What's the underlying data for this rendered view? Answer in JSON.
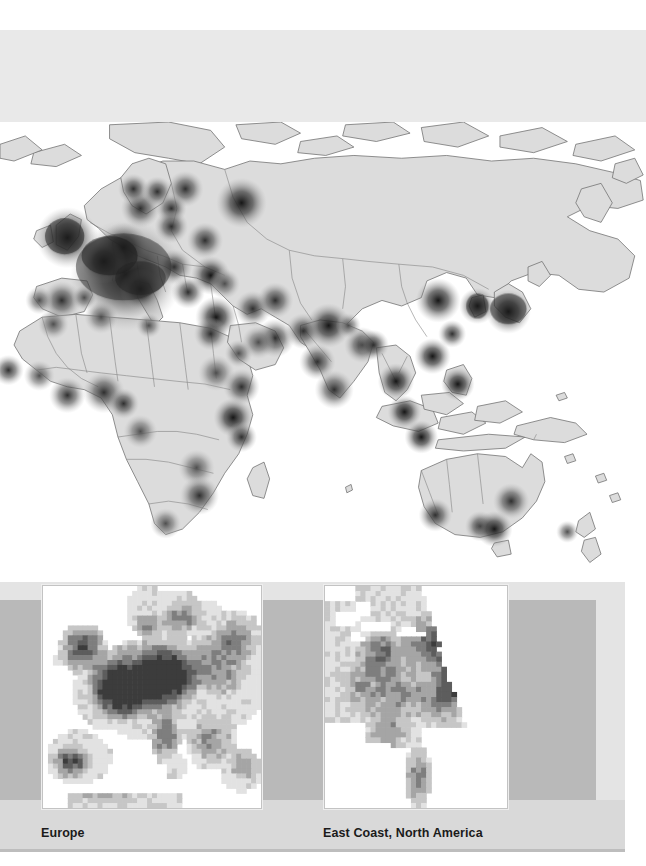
{
  "figure": {
    "kind": "thematic world map with regional detail insets",
    "background_color": "#ffffff",
    "band_tint_color": "#e4e4e4",
    "band_dark_color": "#b9b9b9",
    "caption_band_color": "#d9d9d9"
  },
  "world_map": {
    "name": "world-density-map",
    "land_fill": "#dcdcdc",
    "ocean_fill": "#ffffff",
    "border_stroke": "#6f6f6f",
    "hotspot_palette": [
      "#bdbdbd",
      "#9a9a9a",
      "#6e6e6e",
      "#474747",
      "#2a2a2a"
    ],
    "hotspots": [
      {
        "name": "Western Europe core",
        "x": 90,
        "y": 110,
        "r": 40,
        "level": 5
      },
      {
        "name": "British Isles",
        "x": 48,
        "y": 83,
        "r": 22,
        "level": 5
      },
      {
        "name": "Benelux / Rhine",
        "x": 88,
        "y": 90,
        "r": 18,
        "level": 5
      },
      {
        "name": "Paris basin",
        "x": 74,
        "y": 100,
        "r": 16,
        "level": 5
      },
      {
        "name": "North Italy",
        "x": 100,
        "y": 120,
        "r": 15,
        "level": 5
      },
      {
        "name": "Madrid",
        "x": 44,
        "y": 128,
        "r": 14,
        "level": 4
      },
      {
        "name": "Lisbon",
        "x": 28,
        "y": 128,
        "r": 10,
        "level": 3
      },
      {
        "name": "Barcelona",
        "x": 60,
        "y": 126,
        "r": 9,
        "level": 3
      },
      {
        "name": "Denmark / South Scandinavia",
        "x": 100,
        "y": 62,
        "r": 14,
        "level": 4
      },
      {
        "name": "Oslo",
        "x": 95,
        "y": 48,
        "r": 11,
        "level": 4
      },
      {
        "name": "Stockholm",
        "x": 112,
        "y": 50,
        "r": 11,
        "level": 4
      },
      {
        "name": "Helsinki / St Petersburg",
        "x": 132,
        "y": 48,
        "r": 13,
        "level": 4
      },
      {
        "name": "Baltic",
        "x": 122,
        "y": 62,
        "r": 11,
        "level": 4
      },
      {
        "name": "Warsaw",
        "x": 122,
        "y": 75,
        "r": 12,
        "level": 4
      },
      {
        "name": "Moscow",
        "x": 172,
        "y": 58,
        "r": 18,
        "level": 5
      },
      {
        "name": "Kyiv",
        "x": 146,
        "y": 85,
        "r": 13,
        "level": 4
      },
      {
        "name": "Balkans",
        "x": 124,
        "y": 104,
        "r": 13,
        "level": 4
      },
      {
        "name": "Greece / Athens",
        "x": 134,
        "y": 122,
        "r": 12,
        "level": 4
      },
      {
        "name": "Istanbul",
        "x": 150,
        "y": 110,
        "r": 14,
        "level": 5
      },
      {
        "name": "Ankara",
        "x": 160,
        "y": 116,
        "r": 11,
        "level": 3
      },
      {
        "name": "Levant / Tel Aviv",
        "x": 154,
        "y": 140,
        "r": 15,
        "level": 5
      },
      {
        "name": "Cairo",
        "x": 150,
        "y": 152,
        "r": 12,
        "level": 4
      },
      {
        "name": "Baghdad",
        "x": 180,
        "y": 134,
        "r": 13,
        "level": 4
      },
      {
        "name": "Tehran",
        "x": 196,
        "y": 128,
        "r": 13,
        "level": 4
      },
      {
        "name": "Gulf / Dubai",
        "x": 196,
        "y": 155,
        "r": 14,
        "level": 4
      },
      {
        "name": "Riyadh",
        "x": 184,
        "y": 158,
        "r": 12,
        "level": 3
      },
      {
        "name": "Jeddah",
        "x": 170,
        "y": 166,
        "r": 10,
        "level": 3
      },
      {
        "name": "Casablanca",
        "x": 38,
        "y": 145,
        "r": 11,
        "level": 3
      },
      {
        "name": "Algiers / Tunis",
        "x": 72,
        "y": 140,
        "r": 12,
        "level": 3
      },
      {
        "name": "Tripoli",
        "x": 106,
        "y": 146,
        "r": 9,
        "level": 3
      },
      {
        "name": "Khartoum",
        "x": 154,
        "y": 180,
        "r": 13,
        "level": 3
      },
      {
        "name": "Addis Ababa",
        "x": 172,
        "y": 190,
        "r": 13,
        "level": 4
      },
      {
        "name": "Dakar",
        "x": 6,
        "y": 178,
        "r": 11,
        "level": 4
      },
      {
        "name": "Bamako",
        "x": 28,
        "y": 182,
        "r": 11,
        "level": 3
      },
      {
        "name": "Accra / Abidjan",
        "x": 48,
        "y": 196,
        "r": 13,
        "level": 4
      },
      {
        "name": "Lagos",
        "x": 74,
        "y": 194,
        "r": 15,
        "level": 4
      },
      {
        "name": "Douala",
        "x": 88,
        "y": 202,
        "r": 11,
        "level": 4
      },
      {
        "name": "Kinshasa",
        "x": 100,
        "y": 222,
        "r": 12,
        "level": 3
      },
      {
        "name": "Nairobi",
        "x": 166,
        "y": 212,
        "r": 14,
        "level": 5
      },
      {
        "name": "Dar es Salaam",
        "x": 172,
        "y": 226,
        "r": 11,
        "level": 4
      },
      {
        "name": "Lusaka / Harare",
        "x": 140,
        "y": 248,
        "r": 13,
        "level": 3
      },
      {
        "name": "Johannesburg",
        "x": 142,
        "y": 268,
        "r": 14,
        "level": 4
      },
      {
        "name": "Cape Town",
        "x": 118,
        "y": 288,
        "r": 11,
        "level": 3
      },
      {
        "name": "Karachi",
        "x": 216,
        "y": 150,
        "r": 13,
        "level": 4
      },
      {
        "name": "Delhi",
        "x": 234,
        "y": 146,
        "r": 16,
        "level": 5
      },
      {
        "name": "Mumbai",
        "x": 226,
        "y": 172,
        "r": 13,
        "level": 4
      },
      {
        "name": "Bangalore / Chennai",
        "x": 238,
        "y": 192,
        "r": 14,
        "level": 4
      },
      {
        "name": "Kolkata",
        "x": 258,
        "y": 160,
        "r": 13,
        "level": 4
      },
      {
        "name": "Dhaka",
        "x": 266,
        "y": 160,
        "r": 11,
        "level": 4
      },
      {
        "name": "Kathmandu",
        "x": 248,
        "y": 146,
        "r": 9,
        "level": 3
      },
      {
        "name": "Bangkok",
        "x": 282,
        "y": 186,
        "r": 13,
        "level": 5
      },
      {
        "name": "Singapore / Kuala Lumpur",
        "x": 288,
        "y": 208,
        "r": 12,
        "level": 5
      },
      {
        "name": "Jakarta",
        "x": 300,
        "y": 226,
        "r": 12,
        "level": 5
      },
      {
        "name": "Manila",
        "x": 326,
        "y": 188,
        "r": 12,
        "level": 5
      },
      {
        "name": "Hong Kong / Guangzhou",
        "x": 308,
        "y": 168,
        "r": 13,
        "level": 5
      },
      {
        "name": "Shanghai",
        "x": 322,
        "y": 152,
        "r": 10,
        "level": 4
      },
      {
        "name": "Beijing",
        "x": 312,
        "y": 128,
        "r": 16,
        "level": 5
      },
      {
        "name": "Seoul",
        "x": 340,
        "y": 132,
        "r": 13,
        "level": 5
      },
      {
        "name": "Tokyo / Honshu",
        "x": 362,
        "y": 136,
        "r": 16,
        "level": 5
      },
      {
        "name": "Perth",
        "x": 310,
        "y": 282,
        "r": 12,
        "level": 4
      },
      {
        "name": "Adelaide",
        "x": 342,
        "y": 290,
        "r": 11,
        "level": 4
      },
      {
        "name": "Melbourne",
        "x": 352,
        "y": 292,
        "r": 13,
        "level": 5
      },
      {
        "name": "Sydney / Brisbane",
        "x": 364,
        "y": 272,
        "r": 13,
        "level": 4
      },
      {
        "name": "Auckland",
        "x": 404,
        "y": 294,
        "r": 8,
        "level": 3
      }
    ]
  },
  "insets": [
    {
      "id": "europe",
      "name": "inset-europe",
      "caption": "Europe",
      "style": "rasterized pixel choropleth",
      "cell_palette": [
        "#ffffff",
        "#e2e2e2",
        "#c6c6c6",
        "#a5a5a5",
        "#7e7e7e",
        "#5d5d5d",
        "#3c3c3c"
      ],
      "frame_color": "#c3c3c3"
    },
    {
      "id": "east-coast-north-america",
      "name": "inset-east-coast-north-america",
      "caption": "East Coast, North America",
      "style": "rasterized pixel choropleth",
      "cell_palette": [
        "#ffffff",
        "#e2e2e2",
        "#c6c6c6",
        "#a5a5a5",
        "#7e7e7e",
        "#5d5d5d",
        "#3c3c3c"
      ],
      "frame_color": "#c3c3c3"
    }
  ]
}
